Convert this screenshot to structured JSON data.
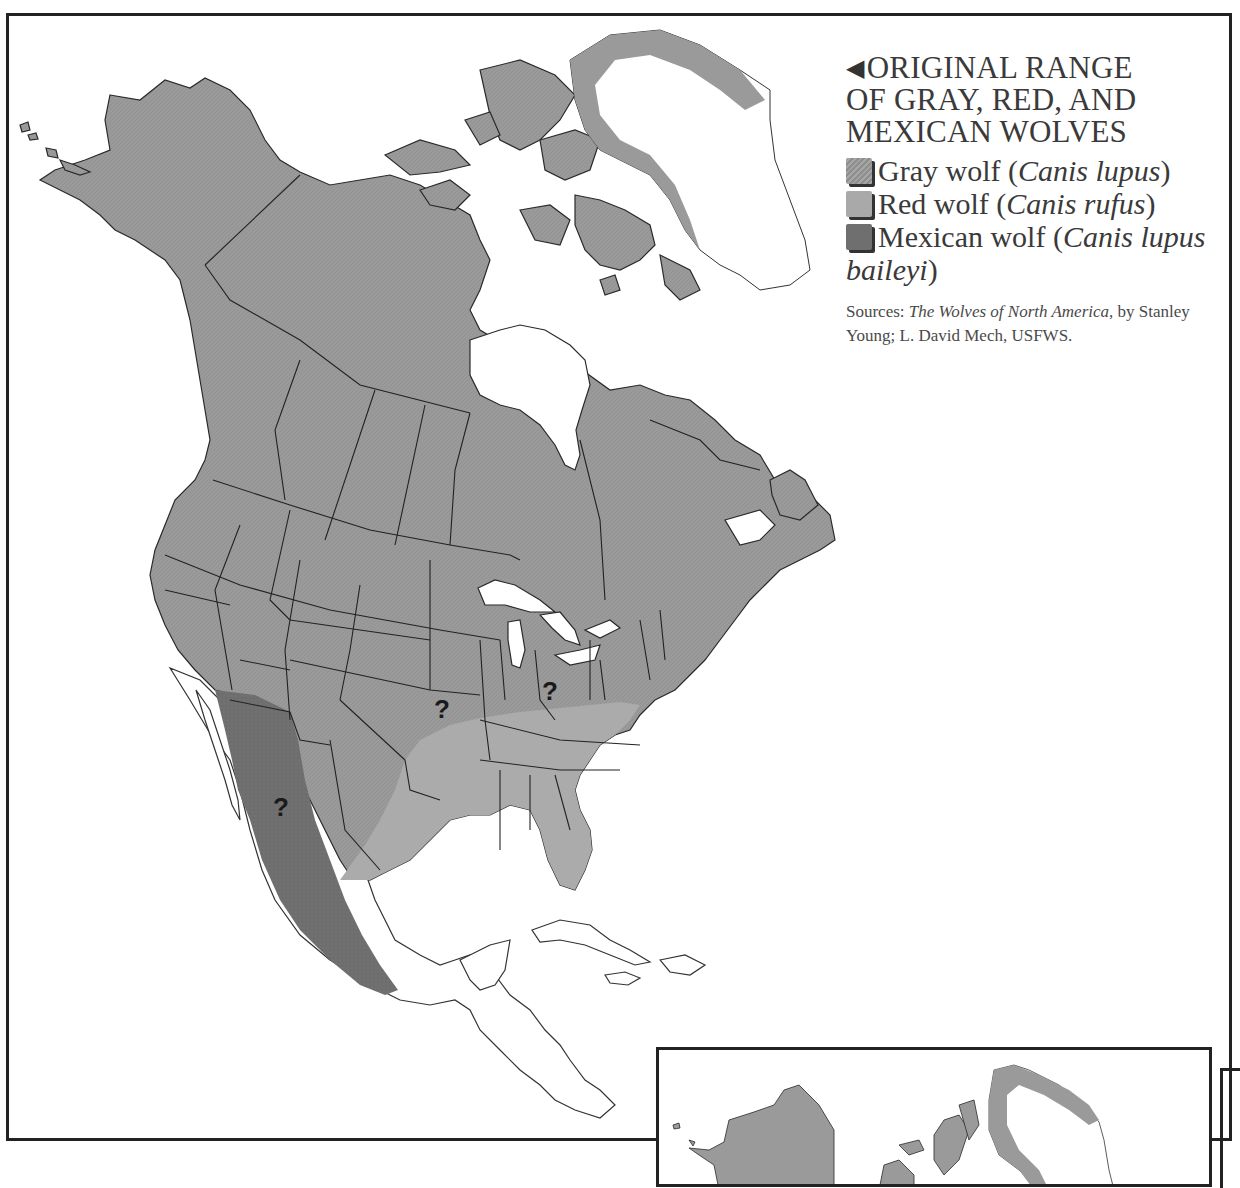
{
  "legend": {
    "arrow_glyph": "◀",
    "title_line1": "ORIGINAL RANGE",
    "title_line2": "OF GRAY, RED, AND",
    "title_line3": "MEXICAN WOLVES",
    "items": [
      {
        "common": "Gray wolf (",
        "scientific": "Canis lupus",
        "close": ")",
        "swatch": "gray",
        "color": "#999999"
      },
      {
        "common": "Red wolf (",
        "scientific": "Canis rufus",
        "close": ")",
        "swatch": "red",
        "color": "#a9a9a9"
      },
      {
        "common": "Mexican wolf (",
        "scientific": "Canis lupus baileyi",
        "close": ")",
        "swatch": "mexican",
        "color": "#6f6f6f"
      }
    ],
    "sources_prefix": "Sources: ",
    "sources_title": "The Wolves of North America",
    "sources_suffix": ", by Stanley Young; L. David Mech, USFWS."
  },
  "map": {
    "uncertain_markers": [
      {
        "label": "?",
        "region": "Missouri (gray/red boundary)",
        "x": 444,
        "y": 714
      },
      {
        "label": "?",
        "region": "Ohio (gray/red boundary)",
        "x": 552,
        "y": 697
      },
      {
        "label": "?",
        "region": "Northern Mexico (Mexican wolf range)",
        "x": 283,
        "y": 812
      }
    ],
    "colors": {
      "gray_wolf": "#999999",
      "red_wolf": "#aaaaaa",
      "mexican_wolf": "#6e6e6e",
      "outline": "#222222",
      "unfilled_land": "#ffffff"
    }
  }
}
